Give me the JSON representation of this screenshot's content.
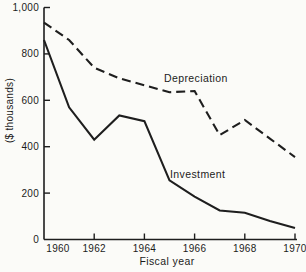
{
  "figure": {
    "background": "#fbfbf8",
    "ink_color": "#1e1e1e"
  },
  "chart_data": {
    "type": "line",
    "title": "",
    "xlabel": "Fiscal year",
    "ylabel": "($ thousands)",
    "x": [
      1960,
      1961,
      1962,
      1963,
      1964,
      1965,
      1966,
      1967,
      1968,
      1969,
      1970
    ],
    "series": [
      {
        "name": "Depreciation",
        "line_style": "dashed",
        "values": [
          935,
          860,
          740,
          695,
          665,
          635,
          640,
          450,
          515,
          435,
          355
        ]
      },
      {
        "name": "Investment",
        "line_style": "solid",
        "values": [
          860,
          570,
          430,
          535,
          510,
          255,
          185,
          125,
          115,
          80,
          50
        ]
      }
    ],
    "xlim": [
      1960,
      1970
    ],
    "ylim": [
      0,
      1000
    ],
    "x_ticks": {
      "values": [
        1960,
        1962,
        1964,
        1966,
        1968,
        1970
      ],
      "labels": [
        "1960",
        "1962",
        "1964",
        "1966",
        "1968",
        "1970"
      ]
    },
    "y_ticks": {
      "values": [
        0,
        200,
        400,
        600,
        800,
        1000
      ],
      "labels": [
        "0",
        "200",
        "400",
        "600",
        "800",
        "1,000"
      ]
    },
    "grid": false,
    "legend": "inline labels beside each line",
    "annotations": [
      {
        "text": "Depreciation",
        "x_px": 164,
        "y_px": 72
      },
      {
        "text": "Investment",
        "x_px": 170,
        "y_px": 168
      }
    ]
  }
}
